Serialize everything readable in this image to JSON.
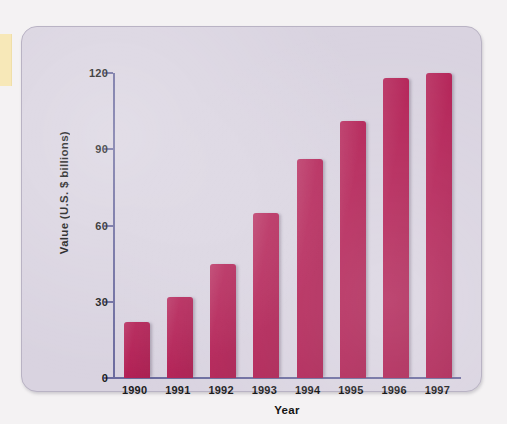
{
  "figure": {
    "panel_background": "#d9d3e0",
    "page_background": "#f4f2f3",
    "margin_tab_color": "#f7e8b8",
    "axis_color": "#6b6a9e",
    "bar_color": "#b32055"
  },
  "chart_data": {
    "type": "bar",
    "title": "",
    "subtitle": "",
    "xlabel": "Year",
    "ylabel": "Value (U.S. $ billions)",
    "categories": [
      "1990",
      "1991",
      "1992",
      "1993",
      "1994",
      "1995",
      "1996",
      "1997"
    ],
    "values": [
      22,
      32,
      45,
      65,
      86,
      101,
      118,
      120
    ],
    "ylim": [
      0,
      120
    ],
    "yticks": [
      0,
      30,
      60,
      90,
      120
    ],
    "ytick_labels": [
      "0",
      "30",
      "60",
      "90",
      "120"
    ],
    "grid": false,
    "legend": null,
    "series": [
      {
        "name": "Value (U.S. $ billions)",
        "color": "#b32055",
        "values": [
          22,
          32,
          45,
          65,
          86,
          101,
          118,
          120
        ]
      }
    ]
  }
}
